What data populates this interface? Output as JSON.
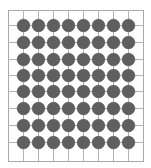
{
  "diagram": {
    "type": "grid-with-stones",
    "rows": 8,
    "cols": 8,
    "border": {
      "x1": 8,
      "y1": 10,
      "x2": 143,
      "y2": 161
    },
    "col_centers": [
      23,
      38,
      53,
      68,
      83,
      98,
      113,
      128
    ],
    "row_centers": [
      25,
      42,
      59,
      75,
      91,
      108,
      125,
      142
    ],
    "stone_radius": 6.3,
    "colors": {
      "grid_line": "#b4b4b4",
      "border": "#a8a8a8",
      "stone": "#5f5f5f",
      "stone_edge": "#4a4a4a",
      "background": "#ffffff"
    }
  }
}
